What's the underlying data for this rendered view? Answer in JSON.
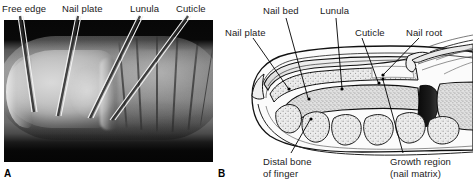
{
  "figure": {
    "panel_a": {
      "letter": "A",
      "type": "photograph",
      "subject": "fingertip-nail-surface-view",
      "labels": [
        {
          "id": "free-edge",
          "text": "Free edge"
        },
        {
          "id": "nail-plate",
          "text": "Nail plate"
        },
        {
          "id": "lunula",
          "text": "Lunula"
        },
        {
          "id": "cuticle",
          "text": "Cuticle"
        }
      ]
    },
    "panel_b": {
      "letter": "B",
      "type": "sagittal-cross-section-diagram",
      "subject": "finger-nail-anatomy",
      "labels": [
        {
          "id": "nail-plate",
          "text": "Nail plate"
        },
        {
          "id": "nail-bed",
          "text": "Nail bed"
        },
        {
          "id": "lunula",
          "text": "Lunula"
        },
        {
          "id": "cuticle",
          "text": "Cuticle"
        },
        {
          "id": "nail-root",
          "text": "Nail root"
        },
        {
          "id": "distal-bone-1",
          "text": "Distal bone"
        },
        {
          "id": "distal-bone-2",
          "text": "of finger"
        },
        {
          "id": "growth-1",
          "text": "Growth region"
        },
        {
          "id": "growth-2",
          "text": "(nail matrix)"
        }
      ]
    },
    "colors": {
      "background": "#ffffff",
      "text": "#1a1a1a",
      "line": "#000000",
      "photo_dark": "#050505",
      "tissue_fill": "#e8e8e8",
      "bone_fill": "#d6d6d6",
      "joint_dark": "#101010"
    }
  }
}
